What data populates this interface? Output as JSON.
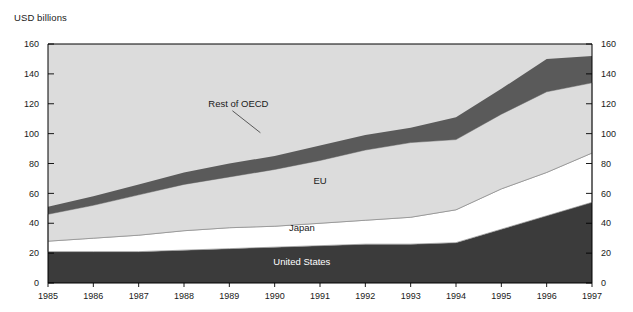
{
  "chart_data": {
    "type": "area",
    "stacked": true,
    "title": "",
    "ylabel": "USD billions",
    "xlabel": "",
    "grid": false,
    "legend_position": "inline-annotations",
    "ylim": [
      0,
      160
    ],
    "yticks": [
      0,
      20,
      40,
      60,
      80,
      100,
      120,
      140,
      160
    ],
    "left_axis_ticks": [
      "0",
      "20",
      "40",
      "60",
      "80",
      "100",
      "120",
      "140",
      "160"
    ],
    "right_axis_ticks": [
      "0",
      "20",
      "40",
      "60",
      "80",
      "100",
      "120",
      "140",
      "160"
    ],
    "categories": [
      1985,
      1986,
      1987,
      1988,
      1989,
      1990,
      1991,
      1992,
      1993,
      1994,
      1995,
      1996,
      1997
    ],
    "xtick_labels": [
      "1985",
      "1986",
      "1987",
      "1988",
      "1989",
      "1990",
      "1991",
      "1992",
      "1993",
      "1994",
      "1995",
      "1996",
      "1997"
    ],
    "series": [
      {
        "name": "United States",
        "label": "United States",
        "color": "#3b3b3b",
        "values": [
          21,
          21,
          21,
          22,
          23,
          24,
          25,
          26,
          26,
          27,
          36,
          45,
          54
        ]
      },
      {
        "name": "Japan",
        "label": "Japan",
        "color": "#ffffff",
        "values": [
          7,
          9,
          11,
          13,
          14,
          14,
          15,
          16,
          18,
          22,
          27,
          29,
          33
        ]
      },
      {
        "name": "EU",
        "label": "EU",
        "color": "#dcdcdc",
        "values": [
          18,
          22,
          27,
          31,
          34,
          38,
          42,
          47,
          50,
          47,
          50,
          54,
          47
        ]
      },
      {
        "name": "Rest of OECD",
        "label": "Rest of OECD",
        "color": "#5a5a5a",
        "values": [
          5,
          6,
          7,
          8,
          9,
          9,
          10,
          10,
          10,
          15,
          17,
          22,
          18
        ]
      }
    ],
    "cumulative_tops": {
      "united_states": [
        21,
        21,
        21,
        22,
        23,
        24,
        25,
        26,
        26,
        27,
        36,
        45,
        54
      ],
      "japan": [
        28,
        30,
        32,
        35,
        37,
        38,
        40,
        42,
        44,
        49,
        63,
        74,
        87
      ],
      "eu": [
        46,
        52,
        59,
        66,
        71,
        76,
        82,
        89,
        94,
        96,
        113,
        128,
        134
      ],
      "rest_of_oecd": [
        51,
        58,
        66,
        74,
        80,
        85,
        92,
        99,
        104,
        111,
        130,
        150,
        152
      ]
    },
    "annotations": [
      {
        "text": "Rest of OECD",
        "x": 1989.2,
        "y": 118,
        "leader": true
      },
      {
        "text": "EU",
        "x": 1991.0,
        "y": 66,
        "leader": false
      },
      {
        "text": "Japan",
        "x": 1990.6,
        "y": 35,
        "leader": false
      },
      {
        "text": "United States",
        "x": 1990.6,
        "y": 12,
        "leader": false
      }
    ],
    "colors": {
      "plot_background": "#dcdcdc",
      "rest_of_oecd": "#5a5a5a",
      "eu": "#dcdcdc",
      "japan": "#ffffff",
      "united_states": "#3b3b3b",
      "axis": "#000000",
      "text": "#1a1a1a"
    }
  }
}
